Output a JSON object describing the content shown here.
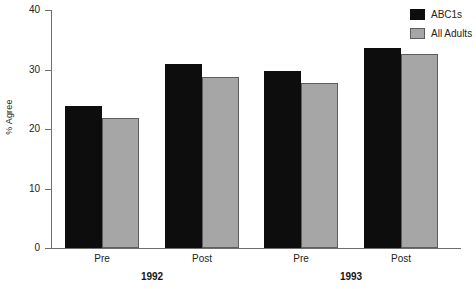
{
  "chart_data": {
    "type": "bar",
    "title": "",
    "xlabel": "",
    "ylabel": "% Agree",
    "ylim": [
      0,
      40
    ],
    "ytick_labels": [
      "0",
      "10",
      "20",
      "30",
      "40"
    ],
    "ytick_values": [
      0,
      10,
      20,
      30,
      40
    ],
    "grid": false,
    "legend_position": "top-right",
    "categories": [
      "Pre",
      "Post",
      "Pre",
      "Post"
    ],
    "group_labels": [
      "1992",
      "1993"
    ],
    "series": [
      {
        "name": "ABC1s",
        "color": "#0d0d0d",
        "values": [
          23.9,
          30.9,
          29.8,
          33.7
        ]
      },
      {
        "name": "All Adults",
        "color": "#a6a6a6",
        "values": [
          21.8,
          28.8,
          27.7,
          32.6
        ]
      }
    ]
  },
  "legend": {
    "items": [
      {
        "label": "ABC1s",
        "swatch": "dark"
      },
      {
        "label": "All Adults",
        "swatch": "light"
      }
    ]
  },
  "axes": {
    "y_title": "% Agree"
  },
  "caption": {
    "text": ""
  }
}
